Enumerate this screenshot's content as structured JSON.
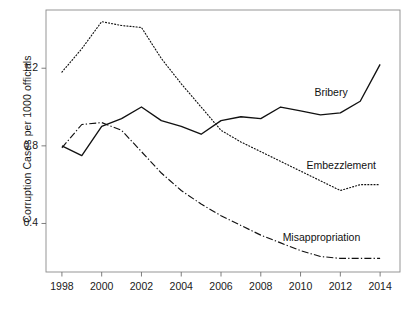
{
  "chart_data": {
    "type": "line",
    "title": "",
    "xlabel": "",
    "ylabel": "Corruption Cases per 1000 officials",
    "xlim": [
      1997.2,
      2015.0
    ],
    "ylim": [
      0.15,
      1.5
    ],
    "xticks": [
      1998,
      2000,
      2002,
      2004,
      2006,
      2008,
      2010,
      2012,
      2014
    ],
    "xtick_labels": [
      "1998",
      "2000",
      "2002",
      "2004",
      "2006",
      "2008",
      "2010",
      "2012",
      "2014"
    ],
    "yticks": [
      0.4,
      0.8,
      1.2
    ],
    "ytick_labels": [
      "0.4",
      "0.8",
      "1.2"
    ],
    "grid": false,
    "legend_position": "inline-annotations",
    "x": [
      1998,
      1999,
      2000,
      2001,
      2002,
      2003,
      2004,
      2005,
      2006,
      2007,
      2008,
      2009,
      2010,
      2011,
      2012,
      2013,
      2014
    ],
    "series": [
      {
        "name": "Bribery",
        "style": "solid",
        "color": "#111111",
        "values": [
          0.8,
          0.75,
          0.9,
          0.94,
          1.0,
          0.93,
          0.9,
          0.86,
          0.93,
          0.95,
          0.94,
          1.0,
          0.98,
          0.96,
          0.97,
          1.03,
          1.22
        ],
        "label": "Bribery",
        "label_x": 2011.0,
        "label_y": 1.07
      },
      {
        "name": "Embezzlement",
        "style": "dotted",
        "color": "#111111",
        "values": [
          1.18,
          1.3,
          1.44,
          1.42,
          1.41,
          1.25,
          1.12,
          1.0,
          0.88,
          0.82,
          0.77,
          0.72,
          0.67,
          0.62,
          0.57,
          0.6,
          0.6
        ],
        "label": "Embezzlement",
        "label_x": 2010.6,
        "label_y": 0.695
      },
      {
        "name": "Misappropriation",
        "style": "dashdot",
        "color": "#111111",
        "values": [
          0.79,
          0.91,
          0.92,
          0.88,
          0.77,
          0.66,
          0.57,
          0.5,
          0.44,
          0.39,
          0.34,
          0.3,
          0.26,
          0.23,
          0.22,
          0.22,
          0.22
        ],
        "label": "Misappropriation",
        "label_x": 2009.4,
        "label_y": 0.325
      }
    ]
  },
  "axes": {
    "y_title": "Corruption Cases per 1000 officials"
  }
}
